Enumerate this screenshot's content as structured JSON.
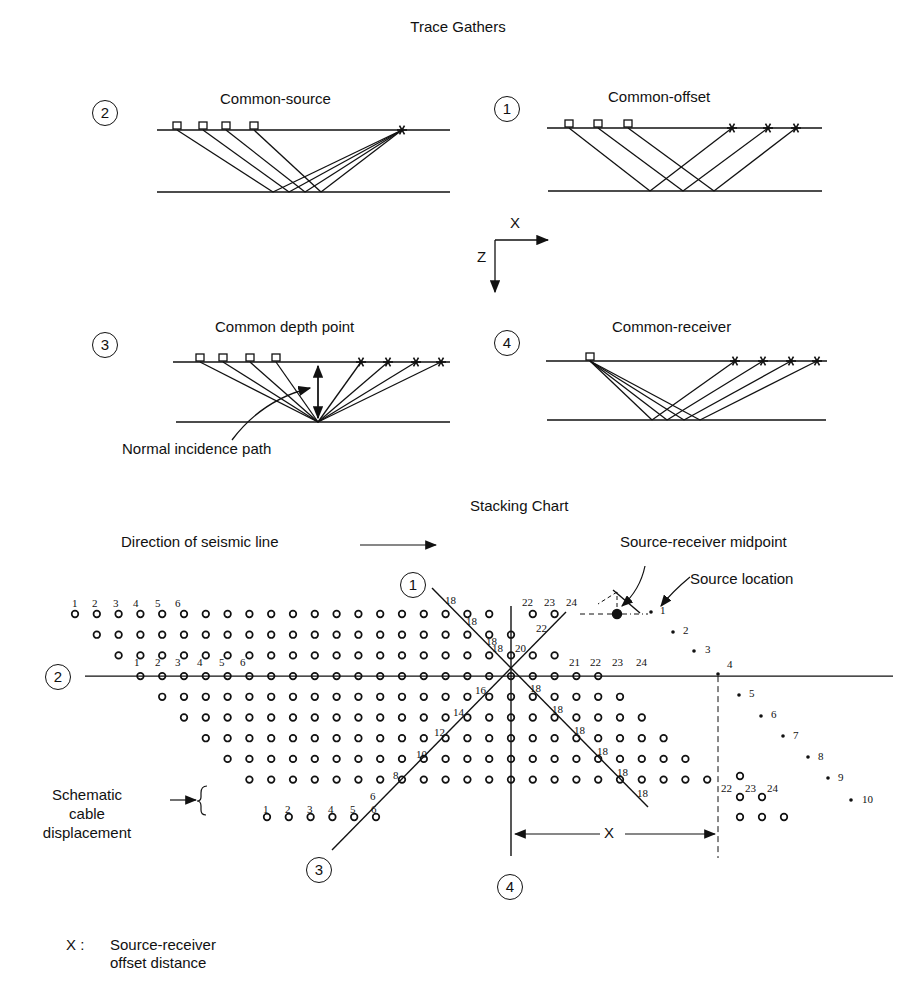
{
  "title": "Trace Gathers",
  "gathers": [
    {
      "id": "2",
      "label": "Common-source",
      "receivers": 4,
      "sources": 1
    },
    {
      "id": "1",
      "label": "Common-offset",
      "receivers": 3,
      "sources": 3
    },
    {
      "id": "3",
      "label": "Common depth point",
      "receivers": 4,
      "sources": 4
    },
    {
      "id": "4",
      "label": "Common-receiver",
      "receivers": 1,
      "sources": 4
    }
  ],
  "axes": {
    "x_label": "X",
    "z_label": "Z"
  },
  "annotations": {
    "normal_incidence": "Normal incidence path"
  },
  "stacking_chart": {
    "title": "Stacking Chart",
    "direction_label": "Direction of seismic line",
    "midpoint_label": "Source-receiver midpoint",
    "source_location_label": "Source location",
    "cable_label_line1": "Schematic",
    "cable_label_line2": "cable",
    "cable_label_line3": "displacement",
    "offset_label": "X",
    "gather_markers": [
      "1",
      "2",
      "3",
      "4"
    ],
    "top_receiver_numbers": [
      "1",
      "2",
      "3",
      "4",
      "5",
      "6"
    ],
    "row4_receiver_numbers": [
      "1",
      "2",
      "3",
      "4",
      "5",
      "6"
    ],
    "row4_right_numbers": [
      "21",
      "22",
      "23",
      "24"
    ],
    "top_right_numbers": [
      "22",
      "23",
      "24"
    ],
    "bottom_receiver_numbers": [
      "1",
      "2",
      "3",
      "4",
      "5",
      "6"
    ],
    "bottom_right_numbers": [
      "22",
      "23",
      "24"
    ],
    "source_numbers": [
      "1",
      "2",
      "3",
      "4",
      "5",
      "6",
      "7",
      "8",
      "9",
      "10"
    ],
    "fold_labels_common_offset": [
      "18",
      "18",
      "18",
      "18",
      "18",
      "18",
      "18",
      "18",
      "18"
    ],
    "fold_labels_cdp": [
      "6",
      "8",
      "10",
      "12",
      "14",
      "16",
      "18",
      "20",
      "22"
    ]
  },
  "legend": {
    "symbol": "X :",
    "line1": "Source-receiver",
    "line2": "offset distance"
  }
}
